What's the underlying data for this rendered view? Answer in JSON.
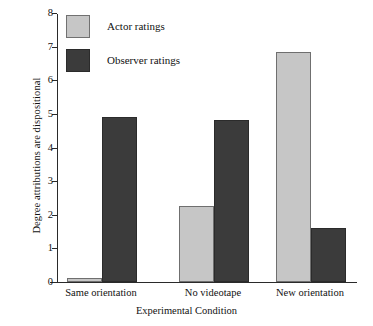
{
  "chart_data": {
    "type": "bar",
    "title": "",
    "xlabel": "Experimental Condition",
    "ylabel": "Degree attributions are dispositional",
    "categories": [
      "Same orientation",
      "No videotape",
      "New orientation"
    ],
    "series": [
      {
        "name": "Actor ratings",
        "color": "#c6c6c6",
        "values": [
          0.12,
          2.25,
          6.85
        ]
      },
      {
        "name": "Observer ratings",
        "color": "#3b3b3b",
        "values": [
          4.92,
          4.83,
          1.62
        ]
      }
    ],
    "ylim": [
      0,
      8
    ],
    "yticks": [
      0,
      1,
      2,
      3,
      4,
      5,
      6,
      7,
      8
    ],
    "ytick_labels": [
      "0",
      "1",
      "2",
      "3",
      "4",
      "5",
      "6",
      "7",
      "8"
    ],
    "grid": false,
    "legend_position": "top-left"
  }
}
